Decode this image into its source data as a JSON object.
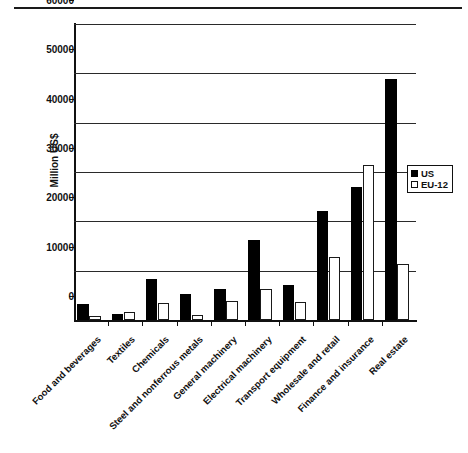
{
  "chart_data": {
    "type": "bar",
    "title": "",
    "subtitle": "",
    "xlabel": "",
    "ylabel": "Million US$",
    "ylim": [
      0,
      60000
    ],
    "ytick_labels": [
      "0",
      "10000",
      "20000",
      "30000",
      "40000",
      "50000",
      "60000"
    ],
    "ytick_values": [
      0,
      10000,
      20000,
      30000,
      40000,
      50000,
      60000
    ],
    "grid": true,
    "legend_position": "right",
    "categories": [
      "Food and beverages",
      "Textiles",
      "Chemicals",
      "Steel and nonferrous metals",
      "General machinery",
      "Electrical machinery",
      "Transport equipment",
      "Wholesale and retail",
      "Finance and insurance",
      "Real estate"
    ],
    "series": [
      {
        "name": "US",
        "color": "#000000",
        "values": [
          3200,
          1200,
          8300,
          5200,
          6300,
          16200,
          7000,
          22000,
          27000,
          48800
        ]
      },
      {
        "name": "EU-12",
        "color": "#ffffff",
        "values": [
          900,
          1600,
          3400,
          1100,
          3900,
          6200,
          3700,
          12800,
          31500,
          11300
        ]
      }
    ]
  },
  "legend": {
    "entries": [
      {
        "label": "US",
        "swatch": "filled-square-icon"
      },
      {
        "label": "EU-12",
        "swatch": "outlined-square-icon"
      }
    ]
  }
}
